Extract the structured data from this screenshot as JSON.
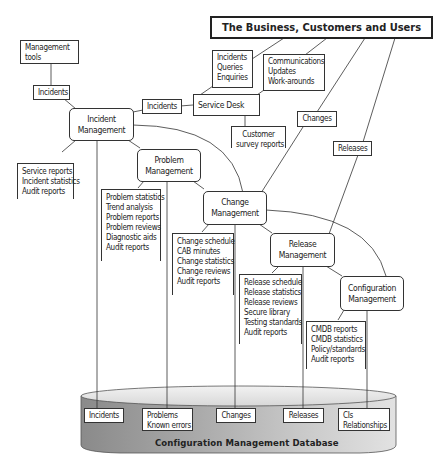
{
  "diagram": {
    "title": "The Business, Customers and Users",
    "management_tools": [
      "Management",
      "tools"
    ],
    "incidents_tools_label": "Incidents",
    "incidents_desk_label": "Incidents",
    "service_desk": "Service Desk",
    "desk_inputs": [
      "Incidents",
      "Queries",
      "Enquiries"
    ],
    "desk_outputs": [
      "Communications",
      "Updates",
      "Work-arounds"
    ],
    "customer_survey": [
      "Customer",
      "survey reports"
    ],
    "changes_label": "Changes",
    "releases_label": "Releases",
    "incident_mgmt": [
      "Incident",
      "Management"
    ],
    "incident_outputs": [
      "Service reports",
      "Incident statistics",
      "Audit reports"
    ],
    "problem_mgmt": [
      "Problem",
      "Management"
    ],
    "problem_outputs": [
      "Problem statistics",
      "Trend analysis",
      "Problem reports",
      "Problem reviews",
      "Diagnostic aids",
      "Audit reports"
    ],
    "change_mgmt": [
      "Change",
      "Management"
    ],
    "change_outputs": [
      "Change schedule",
      "CAB minutes",
      "Change statistics",
      "Change reviews",
      "Audit reports"
    ],
    "release_mgmt": [
      "Release",
      "Management"
    ],
    "release_outputs": [
      "Release schedule",
      "Release statistics",
      "Release reviews",
      "Secure library",
      "Testing standards",
      "Audit reports"
    ],
    "config_mgmt": [
      "Configuration",
      "Management"
    ],
    "config_outputs": [
      "CMDB reports",
      "CMDB statistics",
      "Policy/standards",
      "Audit reports"
    ],
    "database": {
      "label": "Configuration Management Database",
      "records": [
        [
          "Incidents"
        ],
        [
          "Problems",
          "Known errors"
        ],
        [
          "Changes"
        ],
        [
          "Releases"
        ],
        [
          "CIs",
          "Relationships"
        ]
      ]
    }
  },
  "colors": {
    "line": "#333333",
    "db_top": "#e6e6e6",
    "db_side_dark": "#7a7a7a",
    "db_side_light": "#d0d0d0"
  }
}
